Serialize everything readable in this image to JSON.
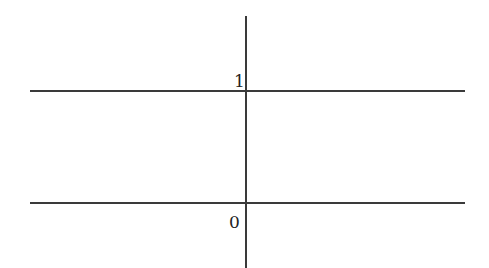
{
  "diagram": {
    "type": "number-line-levels",
    "labels": {
      "upper": "1",
      "lower": "0"
    },
    "colors": {
      "line": "#3a3a3a",
      "text": "#222222",
      "background": "#ffffff"
    }
  }
}
